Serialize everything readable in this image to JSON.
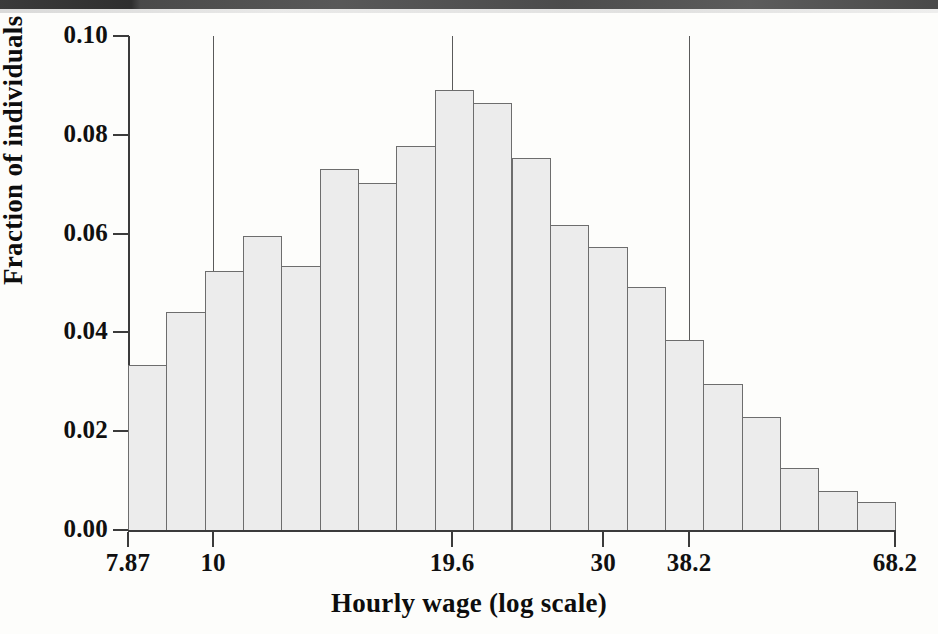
{
  "figure": {
    "y_axis_title": "Fraction of individuals",
    "x_axis_title": "Hourly wage (log scale)",
    "ink_color": "#101010",
    "bar_fill_color": "#ececec",
    "bar_edge_color": "#6d6d6d",
    "background_color": "#fdfdfb"
  },
  "scan_artifacts": {
    "top_band": "",
    "bleed_text": [
      "",
      "",
      "",
      "",
      "",
      "",
      "",
      ""
    ]
  },
  "chart_data": {
    "type": "bar",
    "title": "",
    "xlabel": "Hourly wage (log scale)",
    "ylabel": "Fraction of individuals",
    "xscale": "log",
    "grid": false,
    "legend": null,
    "ylim": [
      0.0,
      0.1
    ],
    "ytick_labels": [
      "0.00",
      "0.02",
      "0.04",
      "0.06",
      "0.08",
      "0.10"
    ],
    "ytick_values": [
      0.0,
      0.02,
      0.04,
      0.06,
      0.08,
      0.1
    ],
    "xtick_labels": [
      "7.87",
      "10",
      "19.6",
      "30",
      "38.2",
      "68.2"
    ],
    "xtick_values": [
      7.87,
      10,
      19.6,
      30,
      38.2,
      68.2
    ],
    "xlim": [
      7.87,
      68.2
    ],
    "reference_lines": [
      10,
      19.6,
      38.2
    ],
    "categories": [
      "7.87",
      "8.25",
      "8.65",
      "9.07",
      "9.51",
      "9.97",
      "10.5",
      "11.0",
      "11.5",
      "12.0",
      "12.6",
      "13.2",
      "13.9",
      "14.5",
      "15.2",
      "16.0",
      "16.8",
      "17.6",
      "18.4",
      "19.3"
    ],
    "values": [
      0.0334,
      0.0442,
      0.0524,
      0.0596,
      0.0534,
      0.0731,
      0.0703,
      0.0778,
      0.0891,
      0.0864,
      0.0753,
      0.0618,
      0.0572,
      0.0492,
      0.0385,
      0.0296,
      0.0228,
      0.0126,
      0.0079,
      0.0056
    ],
    "n_bins": 20
  }
}
